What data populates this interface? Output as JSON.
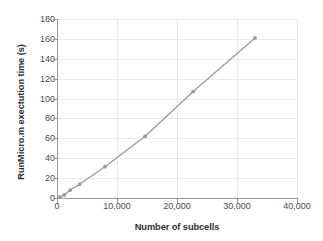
{
  "chart_data": {
    "type": "line",
    "title": "",
    "xlabel": "Number of subcells",
    "ylabel": "RunMicro.m exectution time (s)",
    "xlim": [
      0,
      40000
    ],
    "ylim": [
      0,
      180
    ],
    "xticks": [
      0,
      10000,
      20000,
      30000,
      40000
    ],
    "xtick_labels": [
      "0",
      "10,000",
      "20,000",
      "30,000",
      "40,000"
    ],
    "yticks": [
      0,
      20,
      40,
      60,
      80,
      100,
      120,
      140,
      160,
      180
    ],
    "ytick_labels": [
      "0",
      "20",
      "40",
      "60",
      "80",
      "100",
      "120",
      "140",
      "160",
      "180"
    ],
    "grid": true,
    "grid_color": "#e9e9e9",
    "legend": false,
    "legend_position": "none",
    "series": [
      {
        "name": "RunMicro.m execution time",
        "color": "#9a9a9a",
        "marker": "circle",
        "x": [
          500,
          1200,
          2200,
          3800,
          8000,
          14700,
          22700,
          33000
        ],
        "y": [
          1,
          3,
          8,
          14,
          31.5,
          62,
          107,
          161
        ]
      }
    ]
  },
  "axes": {
    "y_title": "RunMicro.m exectution time (s)",
    "x_title": "Number of subcells"
  },
  "colors": {
    "series_line": "#9a9a9a",
    "grid": "#e9e9e9",
    "axis": "#9a9a9a",
    "text": "#3b3b3b",
    "background": "#ffffff"
  }
}
